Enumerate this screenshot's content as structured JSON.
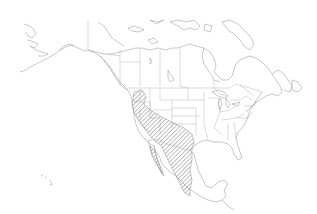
{
  "map": {
    "subject": "Species range map of North America",
    "projection_region": "North America",
    "background_color": "#ffffff",
    "outline_color": "#a8a8a8",
    "range_fill": "diagonal-hatch",
    "range_color": "#8c8c8c",
    "range_region": "Southwestern United States and western/northern Mexico (Oregon, California, Nevada, Arizona, New Mexico, west Texas, Baja California, Sonora, Chihuahua, Durango, Sinaloa)",
    "labels": []
  }
}
